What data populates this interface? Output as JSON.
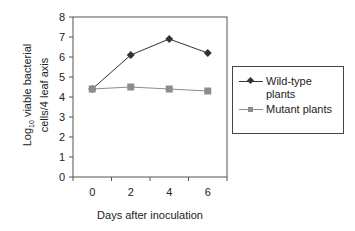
{
  "chart_data": {
    "type": "line",
    "title": "",
    "xlabel": "Days after inoculation",
    "ylabel": "Log10 viable bacterial cells/4 leaf axis",
    "ylabel_parts": {
      "prefix": "Log",
      "sub": "10",
      "line1_rest": " viable bacterial",
      "line2": "cells/4 leaf axis"
    },
    "categories": [
      "0",
      "2",
      "4",
      "6"
    ],
    "yticks": [
      "0",
      "1",
      "2",
      "3",
      "4",
      "5",
      "6",
      "7",
      "8"
    ],
    "ylim": [
      0,
      8
    ],
    "grid": false,
    "legend_position": "right",
    "series": [
      {
        "name": "Wild-type plants",
        "legend_line1": "Wild-type",
        "legend_line2": "plants",
        "values": [
          4.4,
          6.1,
          6.9,
          6.2
        ],
        "color": "#333333",
        "marker": "diamond"
      },
      {
        "name": "Mutant plants",
        "legend_line1": "Mutant plants",
        "values": [
          4.4,
          4.5,
          4.4,
          4.3
        ],
        "color": "#8c8c8c",
        "marker": "square"
      }
    ]
  }
}
